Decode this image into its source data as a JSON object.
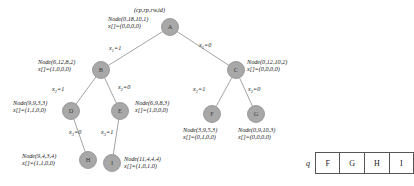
{
  "figure": {
    "header_legend": "(cp,rp,rw,id)",
    "nodes": [
      {
        "id": "A",
        "glyph": "A",
        "cx": 170,
        "cy": 27,
        "r": 8.5,
        "label_line1": "Node(0,18,10,1)",
        "label_line2": "x[]=(0,0,0,0)",
        "label_x": 108,
        "label_y": 15,
        "label_align": "left"
      },
      {
        "id": "B",
        "glyph": "B",
        "cx": 101,
        "cy": 70,
        "r": 8.5,
        "label_line1": "Node(6,12,8,2)",
        "label_line2": "x[]=(1,0,0,0)",
        "label_x": 38,
        "label_y": 58,
        "label_align": "left"
      },
      {
        "id": "C",
        "glyph": "C",
        "cx": 236,
        "cy": 70,
        "r": 8.5,
        "label_line1": "Node(0,12,10,2)",
        "label_line2": "x[]=(0,0,0,0)",
        "label_x": 247,
        "label_y": 58,
        "label_align": "left"
      },
      {
        "id": "D",
        "glyph": "D",
        "cx": 71,
        "cy": 111,
        "r": 8.5,
        "label_line1": "Node(9,9,3,3)",
        "label_line2": "x[]=(1,1,0,0)",
        "label_x": 13,
        "label_y": 99,
        "label_align": "left"
      },
      {
        "id": "E",
        "glyph": "E",
        "cx": 120,
        "cy": 111,
        "r": 8.5,
        "label_line1": "Node(6,9,8,3)",
        "label_line2": "x[]=(1,0,0,0)",
        "label_x": 135,
        "label_y": 99,
        "label_align": "left"
      },
      {
        "id": "F",
        "glyph": "F",
        "cx": 212,
        "cy": 114,
        "r": 8.5,
        "label_line1": "Node(3,9,5,3)",
        "label_line2": "x[]=(0,1,0,0)",
        "label_x": 183,
        "label_y": 126,
        "label_align": "left"
      },
      {
        "id": "G",
        "glyph": "G",
        "cx": 256,
        "cy": 114,
        "r": 8.5,
        "label_line1": "Node(0,9,10,3)",
        "label_line2": "x[]=(0,0,0,0)",
        "label_x": 238,
        "label_y": 126,
        "label_align": "left"
      },
      {
        "id": "H",
        "glyph": "H",
        "cx": 88,
        "cy": 160,
        "r": 8.5,
        "label_line1": "Node(9,4,3,4)",
        "label_line2": "x[]=(1,1,0,0)",
        "label_x": 22,
        "label_y": 152,
        "label_align": "left"
      },
      {
        "id": "I",
        "glyph": "I",
        "cx": 112,
        "cy": 163,
        "r": 8.5,
        "label_line1": "Node(11,4,4,4)",
        "label_line2": "x[]=(1,0,1,0)",
        "label_x": 124,
        "label_y": 155,
        "label_align": "left"
      }
    ],
    "edges": [
      {
        "from": "A",
        "to": "B",
        "label_var": "x",
        "label_sub": "1",
        "label_val": "=1",
        "lx": 109,
        "ly": 44
      },
      {
        "from": "A",
        "to": "C",
        "label_var": "x",
        "label_sub": "1",
        "label_val": "=0",
        "lx": 199,
        "ly": 41
      },
      {
        "from": "B",
        "to": "D",
        "label_var": "x",
        "label_sub": "2",
        "label_val": "=1",
        "lx": 52,
        "ly": 85
      },
      {
        "from": "B",
        "to": "E",
        "label_var": "x",
        "label_sub": "2",
        "label_val": "=0",
        "lx": 118,
        "ly": 83
      },
      {
        "from": "C",
        "to": "F",
        "label_var": "x",
        "label_sub": "2",
        "label_val": "=1",
        "lx": 193,
        "ly": 85
      },
      {
        "from": "C",
        "to": "G",
        "label_var": "x",
        "label_sub": "2",
        "label_val": "=0",
        "lx": 248,
        "ly": 85
      },
      {
        "from": "D",
        "to": "H",
        "label_var": "x",
        "label_sub": "3",
        "label_val": "=0",
        "lx": 69,
        "ly": 128
      },
      {
        "from": "E",
        "to": "I",
        "label_var": "x",
        "label_sub": "3",
        "label_val": "=1",
        "lx": 101,
        "ly": 128
      }
    ],
    "colors": {
      "node_fill": "#a8a8a8",
      "node_stroke": "#8c8c8c",
      "edge_stroke": "#9a9a9a",
      "text": "#1a1a1a",
      "table_border": "#555555"
    }
  },
  "queue": {
    "label": "q",
    "cells": [
      "F",
      "G",
      "H",
      "I"
    ]
  }
}
